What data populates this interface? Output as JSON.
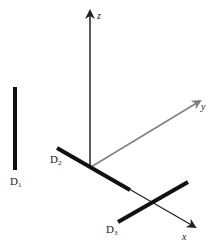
{
  "figure": {
    "axes": {
      "x": {
        "label": "x",
        "color": "#222222"
      },
      "y": {
        "label": "y",
        "color": "#808080"
      },
      "z": {
        "label": "z",
        "color": "#222222"
      }
    },
    "detectors": [
      {
        "name": "D",
        "sub": "1",
        "orientation": "parallel to z, offset"
      },
      {
        "name": "D",
        "sub": "2",
        "orientation": "along x axis"
      },
      {
        "name": "D",
        "sub": "3",
        "orientation": "crossing x axis"
      }
    ],
    "colors": {
      "thick_bar": "#111111",
      "axis": "#222222",
      "y_axis": "#808080"
    }
  }
}
